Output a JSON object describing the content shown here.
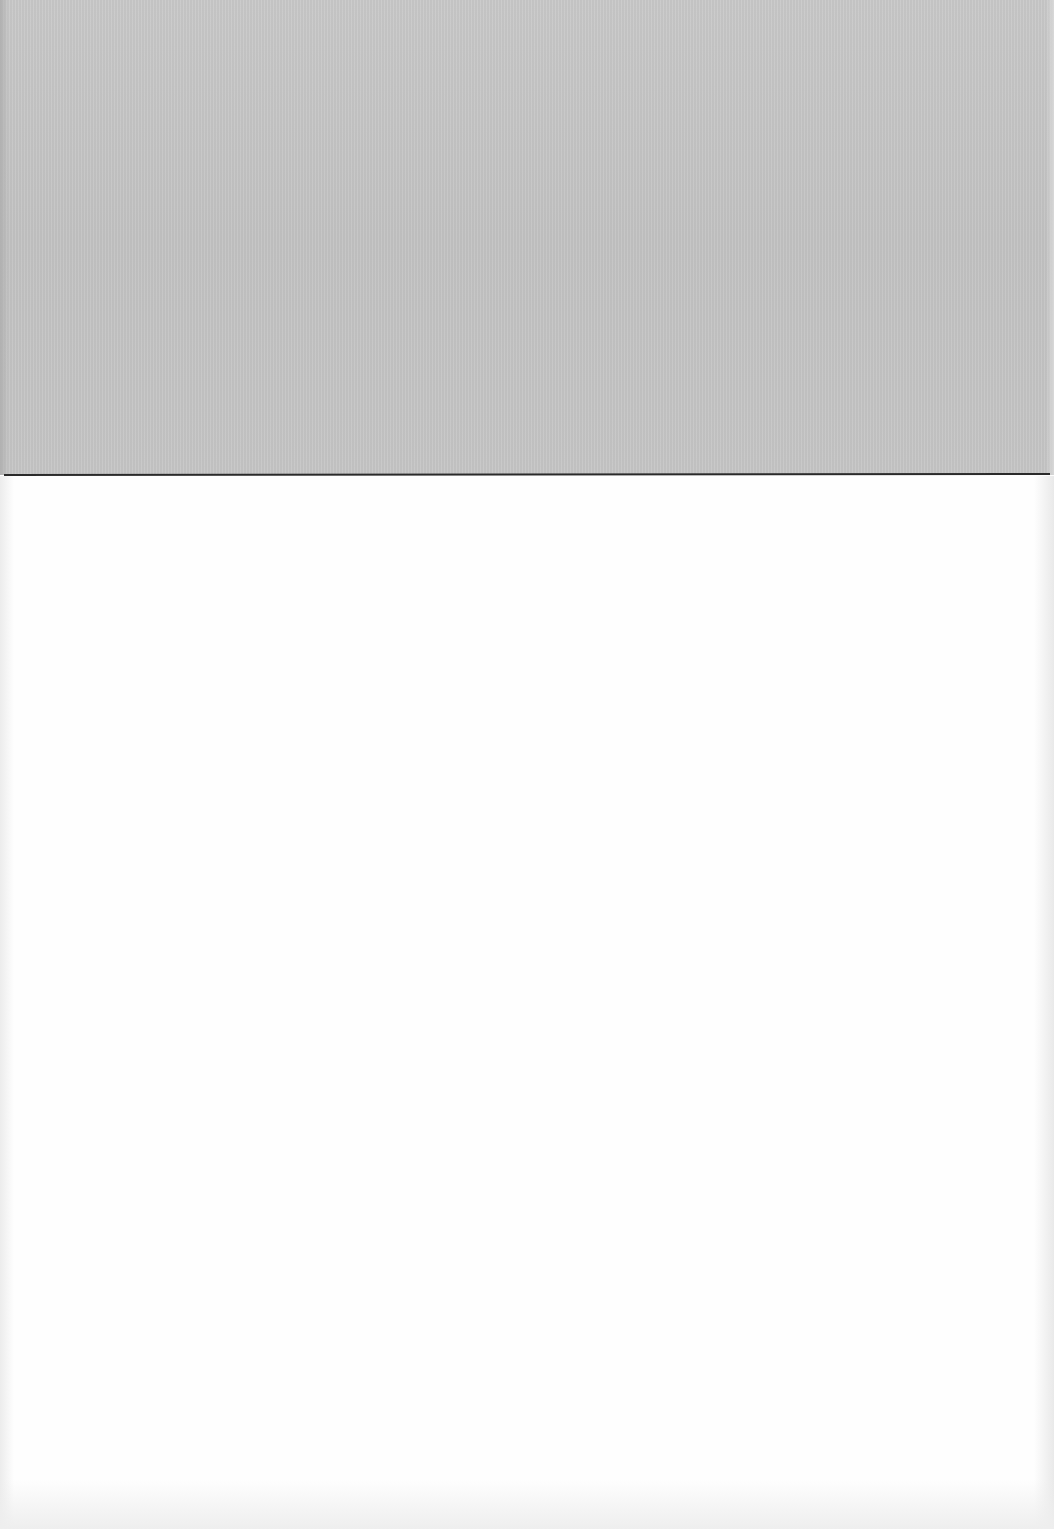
{
  "page": {
    "description": "Blank scanned sheet",
    "regions": [
      {
        "name": "top-gray-band",
        "color": "#c6c6c6"
      },
      {
        "name": "divider-line",
        "color": "#2a2a2a"
      },
      {
        "name": "blank-paper",
        "color": "#fefefe"
      }
    ]
  }
}
